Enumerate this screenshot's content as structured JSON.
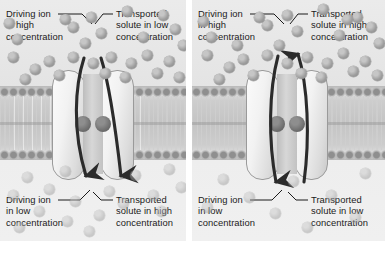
{
  "figure": {
    "background_color": "#ffffff",
    "panel_background": "#e9e9e9",
    "membrane_color": "#c4c4c4",
    "particle_color": "#9d9d9d",
    "arrow_color": "#2b2b2b",
    "protein_fill": "#f2f2f2",
    "binding_site_color": "#6a6a6a"
  },
  "panels": [
    {
      "id": "symport",
      "name": "symport-panel",
      "transport_mode": "symport",
      "arrows": [
        {
          "name": "driving-ion-arrow",
          "direction": "down",
          "side": "left"
        },
        {
          "name": "transported-solute-arrow",
          "direction": "down",
          "side": "right"
        }
      ],
      "labels": {
        "top_left": "Driving ion\nin high\nconcentration",
        "top_right": "Transported\nsolute in low\nconcentration",
        "bottom_left": "Driving ion\nin low\nconcentration",
        "bottom_right": "Transported\nsolute in high\nconcentration"
      },
      "particles_top": [
        {
          "x": 86,
          "y": 12
        },
        {
          "x": 122,
          "y": 6
        },
        {
          "x": 158,
          "y": 10
        },
        {
          "x": 68,
          "y": 22
        },
        {
          "x": 96,
          "y": 28
        },
        {
          "x": 12,
          "y": 34
        },
        {
          "x": 138,
          "y": 32
        },
        {
          "x": 170,
          "y": 24
        },
        {
          "x": 80,
          "y": 38
        },
        {
          "x": 8,
          "y": 52
        },
        {
          "x": 44,
          "y": 56
        },
        {
          "x": 68,
          "y": 52
        },
        {
          "x": 88,
          "y": 58
        },
        {
          "x": 106,
          "y": 52
        },
        {
          "x": 126,
          "y": 58
        },
        {
          "x": 142,
          "y": 50
        },
        {
          "x": 164,
          "y": 56
        },
        {
          "x": 30,
          "y": 64
        },
        {
          "x": 54,
          "y": 70
        },
        {
          "x": 100,
          "y": 68
        },
        {
          "x": 120,
          "y": 72
        },
        {
          "x": 152,
          "y": 68
        },
        {
          "x": 174,
          "y": 72
        },
        {
          "x": 20,
          "y": 74
        },
        {
          "x": 4,
          "y": 18
        },
        {
          "x": 178,
          "y": 40
        },
        {
          "x": 60,
          "y": 14
        }
      ],
      "particles_bottom": [
        {
          "x": 22,
          "y": 172
        },
        {
          "x": 60,
          "y": 166
        },
        {
          "x": 130,
          "y": 170
        },
        {
          "x": 164,
          "y": 164
        },
        {
          "x": 44,
          "y": 184
        },
        {
          "x": 8,
          "y": 190
        },
        {
          "x": 104,
          "y": 186
        },
        {
          "x": 148,
          "y": 190
        },
        {
          "x": 176,
          "y": 182
        },
        {
          "x": 70,
          "y": 196
        },
        {
          "x": 118,
          "y": 198
        },
        {
          "x": 34,
          "y": 206
        },
        {
          "x": 94,
          "y": 210
        },
        {
          "x": 62,
          "y": 216
        },
        {
          "x": 156,
          "y": 206
        },
        {
          "x": 14,
          "y": 222
        },
        {
          "x": 84,
          "y": 226
        }
      ]
    },
    {
      "id": "antiport",
      "name": "antiport-panel",
      "transport_mode": "antiport",
      "arrows": [
        {
          "name": "driving-ion-arrow",
          "direction": "down",
          "side": "left"
        },
        {
          "name": "transported-solute-arrow",
          "direction": "up",
          "side": "right"
        }
      ],
      "labels": {
        "top_left": "Driving ion\nin high\nconcentration",
        "top_right": "Transported\nsolute in high\nconcentration",
        "bottom_left": "Driving ion\nin low\nconcentration",
        "bottom_right": "Transported\nsolute in low\nconcentration"
      },
      "particles_top": [
        {
          "x": 90,
          "y": 10
        },
        {
          "x": 126,
          "y": 4
        },
        {
          "x": 160,
          "y": 12
        },
        {
          "x": 70,
          "y": 20
        },
        {
          "x": 100,
          "y": 26
        },
        {
          "x": 14,
          "y": 32
        },
        {
          "x": 142,
          "y": 30
        },
        {
          "x": 174,
          "y": 22
        },
        {
          "x": 82,
          "y": 40
        },
        {
          "x": 10,
          "y": 50
        },
        {
          "x": 46,
          "y": 54
        },
        {
          "x": 70,
          "y": 50
        },
        {
          "x": 90,
          "y": 58
        },
        {
          "x": 110,
          "y": 52
        },
        {
          "x": 130,
          "y": 58
        },
        {
          "x": 146,
          "y": 48
        },
        {
          "x": 168,
          "y": 56
        },
        {
          "x": 32,
          "y": 62
        },
        {
          "x": 56,
          "y": 70
        },
        {
          "x": 104,
          "y": 68
        },
        {
          "x": 124,
          "y": 72
        },
        {
          "x": 156,
          "y": 66
        },
        {
          "x": 180,
          "y": 70
        },
        {
          "x": 22,
          "y": 74
        },
        {
          "x": 6,
          "y": 16
        },
        {
          "x": 182,
          "y": 38
        },
        {
          "x": 62,
          "y": 12
        },
        {
          "x": 40,
          "y": 40
        },
        {
          "x": 150,
          "y": 14
        }
      ],
      "particles_bottom": [
        {
          "x": 26,
          "y": 174
        },
        {
          "x": 96,
          "y": 176
        },
        {
          "x": 168,
          "y": 168
        },
        {
          "x": 52,
          "y": 192
        },
        {
          "x": 134,
          "y": 190
        },
        {
          "x": 10,
          "y": 202
        },
        {
          "x": 78,
          "y": 208
        },
        {
          "x": 158,
          "y": 212
        },
        {
          "x": 110,
          "y": 222
        }
      ]
    }
  ]
}
